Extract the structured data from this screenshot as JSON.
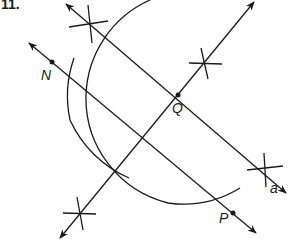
{
  "problem": {
    "number": "11."
  },
  "labels": {
    "N": "N",
    "Q": "Q",
    "P": "P",
    "a": "a"
  },
  "colors": {
    "stroke": "#1a1a1a",
    "background": "#ffffff"
  },
  "geometry": {
    "line_a": {
      "from": [
        64,
        3
      ],
      "to": [
        287,
        194
      ],
      "description": "line a with arrows both ends"
    },
    "line_NP": {
      "from": [
        28,
        42
      ],
      "to": [
        256,
        233
      ],
      "description": "line through N and P, parallel to a"
    },
    "perpendicular": {
      "from": [
        255,
        1
      ],
      "to": [
        59,
        238
      ],
      "description": "perpendicular through Q"
    },
    "point_Q": [
      178,
      95
    ],
    "point_N": [
      52,
      62
    ],
    "point_P": [
      232,
      213
    ],
    "big_arc": {
      "center": [
        178,
        95
      ],
      "radius": 108
    },
    "small_arc": {
      "center": [
        178,
        95
      ],
      "radius": 115
    },
    "cross_marks": [
      [
        89,
        22
      ],
      [
        205,
        62
      ],
      [
        265,
        170
      ],
      [
        79,
        214
      ]
    ]
  }
}
